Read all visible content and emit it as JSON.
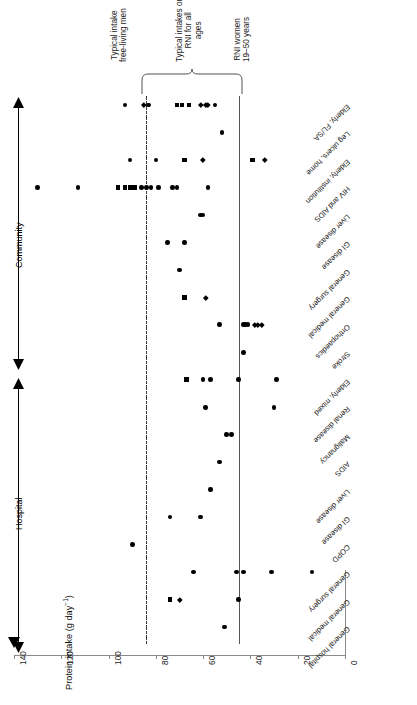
{
  "figure": {
    "orientation": "rotated-90",
    "axis_title": "Protein intake (g day",
    "axis_title_sup": "−1",
    "axis_title_tail": ")",
    "group_labels": {
      "hospital": "Hospital",
      "community": "Community"
    }
  },
  "annotations": [
    {
      "name": "typical-intake-free-living-men",
      "line1": "Typical intake",
      "line2": "free-living men",
      "value": 85,
      "line_style": "dash-dot"
    },
    {
      "name": "typical-intakes-rni-all-ages",
      "line1": "Typical intakes or",
      "line2": "RNI for all",
      "line3": "ages",
      "range": [
        53,
        85
      ],
      "line_style": "brace"
    },
    {
      "name": "rni-women-19-50",
      "line1": "RNI women",
      "line2": "19–50 years",
      "value": 45,
      "line_style": "solid"
    }
  ],
  "chart_data": {
    "type": "scatter",
    "title": "",
    "xlabel": "",
    "ylabel": "Protein intake (g day⁻¹)",
    "ylim": [
      0,
      140
    ],
    "yticks": [
      0,
      20,
      40,
      60,
      80,
      100,
      120,
      140
    ],
    "grid": false,
    "legend": "none",
    "marker_shapes": [
      "circle",
      "square",
      "diamond"
    ],
    "reference_lines": [
      {
        "label": "Typical intake free-living men",
        "value": 85,
        "style": "dash-dot"
      },
      {
        "label": "RNI women 19-50 years",
        "value": 45,
        "style": "solid"
      }
    ],
    "groups": [
      {
        "name": "Hospital",
        "categories": [
          "General hospital",
          "General medical",
          "General surgery",
          "COPD",
          "GI disease",
          "Liver disease",
          "AIDS",
          "Malignancy",
          "Renal disease",
          "Elderly, mixed",
          "Stroke",
          "Orthopaedics"
        ]
      },
      {
        "name": "Community",
        "categories": [
          "General medical",
          "General surgery",
          "GI disease",
          "Liver disease",
          "HIV and AIDS",
          "Elderly, institution",
          "Leg ulcers, home",
          "Elderly, FL/SA"
        ]
      }
    ],
    "categories": [
      "General hospital",
      "General medical",
      "General surgery",
      "COPD",
      "GI disease",
      "Liver disease",
      "AIDS",
      "Malignancy",
      "Renal disease",
      "Elderly, mixed",
      "Stroke",
      "Orthopaedics",
      "General medical",
      "General surgery",
      "GI disease",
      "Liver disease",
      "HIV and AIDS",
      "Elderly, institution",
      "Leg ulcers, home",
      "Elderly, FL/SA"
    ],
    "series": [
      {
        "category": "General hospital",
        "points": [
          {
            "v": 51,
            "m": "circle"
          }
        ]
      },
      {
        "category": "General medical",
        "points": [
          {
            "v": 74,
            "m": "square"
          },
          {
            "v": 70,
            "m": "diamond"
          },
          {
            "v": 45,
            "m": "circle"
          }
        ]
      },
      {
        "category": "General surgery",
        "points": [
          {
            "v": 64,
            "m": "circle"
          },
          {
            "v": 46,
            "m": "circle"
          },
          {
            "v": 43,
            "m": "circle"
          },
          {
            "v": 31,
            "m": "circle"
          },
          {
            "v": 14,
            "m": "circle"
          }
        ]
      },
      {
        "category": "COPD",
        "points": [
          {
            "v": 90,
            "m": "circle"
          }
        ]
      },
      {
        "category": "GI disease",
        "points": [
          {
            "v": 74,
            "m": "circle"
          },
          {
            "v": 61,
            "m": "circle"
          }
        ]
      },
      {
        "category": "Liver disease",
        "points": [
          {
            "v": 57,
            "m": "circle"
          }
        ]
      },
      {
        "category": "AIDS",
        "points": [
          {
            "v": 53,
            "m": "circle"
          }
        ]
      },
      {
        "category": "Malignancy",
        "points": [
          {
            "v": 50,
            "m": "circle"
          },
          {
            "v": 48,
            "m": "circle"
          }
        ]
      },
      {
        "category": "Renal disease",
        "points": [
          {
            "v": 59,
            "m": "circle"
          },
          {
            "v": 30,
            "m": "circle"
          }
        ]
      },
      {
        "category": "Elderly, mixed",
        "points": [
          {
            "v": 67,
            "m": "square"
          },
          {
            "v": 60,
            "m": "circle"
          },
          {
            "v": 57,
            "m": "circle"
          },
          {
            "v": 45,
            "m": "circle"
          },
          {
            "v": 29,
            "m": "circle"
          }
        ]
      },
      {
        "category": "Stroke",
        "points": [
          {
            "v": 43,
            "m": "circle"
          }
        ]
      },
      {
        "category": "Orthopaedics",
        "points": [
          {
            "v": 53,
            "m": "circle"
          },
          {
            "v": 43,
            "m": "circle"
          },
          {
            "v": 42,
            "m": "circle"
          },
          {
            "v": 41,
            "m": "circle"
          },
          {
            "v": 38,
            "m": "diamond"
          },
          {
            "v": 37,
            "m": "diamond"
          },
          {
            "v": 35,
            "m": "diamond"
          }
        ]
      },
      {
        "category": "General medical",
        "points": [
          {
            "v": 68,
            "m": "square"
          },
          {
            "v": 59,
            "m": "diamond"
          }
        ]
      },
      {
        "category": "General surgery",
        "points": [
          {
            "v": 70,
            "m": "circle"
          }
        ]
      },
      {
        "category": "GI disease",
        "points": [
          {
            "v": 75,
            "m": "circle"
          },
          {
            "v": 68,
            "m": "circle"
          }
        ]
      },
      {
        "category": "Liver disease",
        "points": [
          {
            "v": 61,
            "m": "circle"
          },
          {
            "v": 60,
            "m": "circle"
          }
        ]
      },
      {
        "category": "HIV and AIDS",
        "points": [
          {
            "v": 130,
            "m": "circle"
          },
          {
            "v": 113,
            "m": "circle"
          },
          {
            "v": 96,
            "m": "square"
          },
          {
            "v": 93,
            "m": "square"
          },
          {
            "v": 91,
            "m": "square"
          },
          {
            "v": 89,
            "m": "square"
          },
          {
            "v": 86,
            "m": "circle"
          },
          {
            "v": 84,
            "m": "circle"
          },
          {
            "v": 82,
            "m": "circle"
          },
          {
            "v": 79,
            "m": "circle"
          },
          {
            "v": 73,
            "m": "circle"
          },
          {
            "v": 71,
            "m": "circle"
          },
          {
            "v": 58,
            "m": "circle"
          }
        ]
      },
      {
        "category": "Elderly, institution",
        "points": [
          {
            "v": 91,
            "m": "circle"
          },
          {
            "v": 80,
            "m": "circle"
          },
          {
            "v": 68,
            "m": "square"
          },
          {
            "v": 60,
            "m": "diamond"
          },
          {
            "v": 39,
            "m": "square"
          },
          {
            "v": 34,
            "m": "diamond"
          }
        ]
      },
      {
        "category": "Leg ulcers, home",
        "points": [
          {
            "v": 52,
            "m": "circle"
          }
        ]
      },
      {
        "category": "Elderly, FL/SA",
        "points": [
          {
            "v": 93,
            "m": "circle"
          },
          {
            "v": 85,
            "m": "diamond"
          },
          {
            "v": 83,
            "m": "circle"
          },
          {
            "v": 71,
            "m": "square"
          },
          {
            "v": 69,
            "m": "square"
          },
          {
            "v": 66,
            "m": "square"
          },
          {
            "v": 61,
            "m": "diamond"
          },
          {
            "v": 59,
            "m": "diamond"
          },
          {
            "v": 58,
            "m": "diamond"
          },
          {
            "v": 55,
            "m": "circle"
          }
        ]
      }
    ]
  }
}
